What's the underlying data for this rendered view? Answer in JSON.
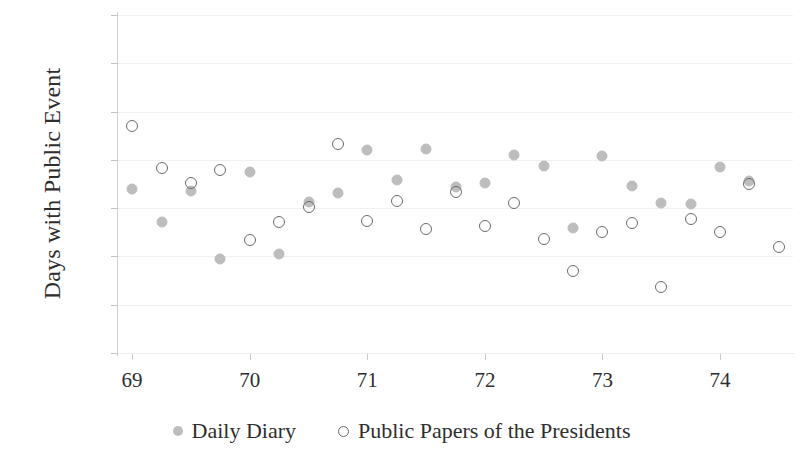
{
  "chart_data": {
    "type": "scatter",
    "title": "",
    "xlabel": "",
    "ylabel": "Days with Public Event",
    "xlim": [
      68.88,
      74.62
    ],
    "ylim": [
      0,
      0.7
    ],
    "grid": true,
    "legend_position": "bottom",
    "y_tick_labels": [
      "70%",
      "60%",
      "50%",
      "40%",
      "30%",
      "20%",
      "10%",
      "0%"
    ],
    "y_tick_values": [
      0.7,
      0.6,
      0.5,
      0.4,
      0.3,
      0.2,
      0.1,
      0.0
    ],
    "x_tick_labels": [
      "69",
      "70",
      "71",
      "72",
      "73",
      "74"
    ],
    "x_tick_values": [
      69,
      70,
      71,
      72,
      73,
      74
    ],
    "series": [
      {
        "name": "Daily Diary",
        "marker": "filled-circle",
        "color": "#bdbdbd",
        "points": [
          {
            "x": 69.0,
            "y": 0.34
          },
          {
            "x": 69.25,
            "y": 0.272
          },
          {
            "x": 69.5,
            "y": 0.335
          },
          {
            "x": 69.75,
            "y": 0.195
          },
          {
            "x": 70.0,
            "y": 0.375
          },
          {
            "x": 70.25,
            "y": 0.206
          },
          {
            "x": 70.5,
            "y": 0.312
          },
          {
            "x": 70.75,
            "y": 0.332
          },
          {
            "x": 71.0,
            "y": 0.421
          },
          {
            "x": 71.25,
            "y": 0.358
          },
          {
            "x": 71.5,
            "y": 0.422
          },
          {
            "x": 71.75,
            "y": 0.343
          },
          {
            "x": 72.0,
            "y": 0.352
          },
          {
            "x": 72.25,
            "y": 0.411
          },
          {
            "x": 72.5,
            "y": 0.388
          },
          {
            "x": 72.75,
            "y": 0.259
          },
          {
            "x": 73.0,
            "y": 0.409
          },
          {
            "x": 73.25,
            "y": 0.346
          },
          {
            "x": 73.5,
            "y": 0.31
          },
          {
            "x": 73.75,
            "y": 0.309
          },
          {
            "x": 74.0,
            "y": 0.386
          },
          {
            "x": 74.25,
            "y": 0.356
          }
        ]
      },
      {
        "name": "Public Papers of the Presidents",
        "marker": "open-circle",
        "color": "#6b6b6b",
        "points": [
          {
            "x": 69.0,
            "y": 0.47
          },
          {
            "x": 69.25,
            "y": 0.383
          },
          {
            "x": 69.5,
            "y": 0.352
          },
          {
            "x": 69.75,
            "y": 0.379
          },
          {
            "x": 70.0,
            "y": 0.233
          },
          {
            "x": 70.25,
            "y": 0.271
          },
          {
            "x": 70.5,
            "y": 0.302
          },
          {
            "x": 70.75,
            "y": 0.432
          },
          {
            "x": 71.0,
            "y": 0.274
          },
          {
            "x": 71.25,
            "y": 0.315
          },
          {
            "x": 71.5,
            "y": 0.257
          },
          {
            "x": 71.75,
            "y": 0.334
          },
          {
            "x": 72.0,
            "y": 0.264
          },
          {
            "x": 72.25,
            "y": 0.31
          },
          {
            "x": 72.5,
            "y": 0.236
          },
          {
            "x": 72.75,
            "y": 0.17
          },
          {
            "x": 73.0,
            "y": 0.251
          },
          {
            "x": 73.25,
            "y": 0.269
          },
          {
            "x": 73.5,
            "y": 0.136
          },
          {
            "x": 73.75,
            "y": 0.278
          },
          {
            "x": 74.0,
            "y": 0.25
          },
          {
            "x": 74.25,
            "y": 0.35
          },
          {
            "x": 74.5,
            "y": 0.219
          }
        ]
      }
    ]
  },
  "legend": {
    "items": [
      {
        "label": "Daily Diary",
        "marker": "filled-circle"
      },
      {
        "label": "Public Papers of the Presidents",
        "marker": "open-circle"
      }
    ]
  }
}
